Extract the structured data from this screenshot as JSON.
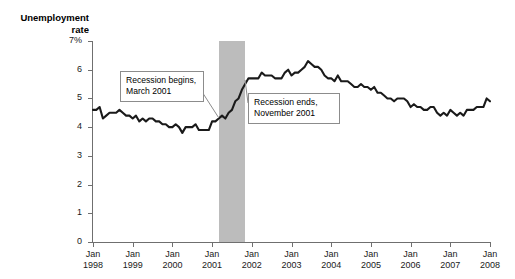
{
  "chart_data": {
    "type": "line",
    "title": "Unemployment\nrate",
    "xlabel": "",
    "ylabel": "Unemployment rate",
    "ylim": [
      0,
      7
    ],
    "ytick_labels": [
      "7%",
      "6",
      "5",
      "4",
      "3",
      "2",
      "1",
      "0"
    ],
    "ytick_values": [
      7,
      6,
      5,
      4,
      3,
      2,
      1,
      0
    ],
    "xtick_labels": [
      "Jan\n1998",
      "Jan\n1999",
      "Jan\n2000",
      "Jan\n2001",
      "Jan\n2002",
      "Jan\n2003",
      "Jan\n2004",
      "Jan\n2005",
      "Jan\n2006",
      "Jan\n2007",
      "Jan\n2008"
    ],
    "xtick_values": [
      1998,
      1999,
      2000,
      2001,
      2002,
      2003,
      2004,
      2005,
      2006,
      2007,
      2008
    ],
    "grid": false,
    "legend": false,
    "line_color": "#1a1a1a",
    "band_color": "#bcbcbc",
    "x_start": 1998.0,
    "x_end": 2008.0,
    "series": [
      {
        "name": "Unemployment rate",
        "values": [
          4.6,
          4.6,
          4.7,
          4.3,
          4.4,
          4.5,
          4.5,
          4.5,
          4.6,
          4.5,
          4.4,
          4.4,
          4.3,
          4.4,
          4.2,
          4.3,
          4.2,
          4.3,
          4.3,
          4.2,
          4.2,
          4.1,
          4.1,
          4.0,
          4.0,
          4.1,
          4.0,
          3.8,
          4.0,
          4.0,
          4.0,
          4.1,
          3.9,
          3.9,
          3.9,
          3.9,
          4.2,
          4.2,
          4.3,
          4.4,
          4.3,
          4.5,
          4.6,
          4.9,
          5.0,
          5.3,
          5.5,
          5.7,
          5.7,
          5.7,
          5.7,
          5.9,
          5.8,
          5.8,
          5.8,
          5.7,
          5.7,
          5.7,
          5.9,
          6.0,
          5.8,
          5.9,
          5.9,
          6.0,
          6.1,
          6.3,
          6.2,
          6.1,
          6.1,
          6.0,
          5.8,
          5.7,
          5.7,
          5.6,
          5.8,
          5.6,
          5.6,
          5.6,
          5.5,
          5.4,
          5.4,
          5.5,
          5.4,
          5.4,
          5.3,
          5.4,
          5.2,
          5.2,
          5.1,
          5.0,
          5.0,
          4.9,
          5.0,
          5.0,
          5.0,
          4.9,
          4.7,
          4.8,
          4.7,
          4.7,
          4.6,
          4.6,
          4.7,
          4.7,
          4.5,
          4.4,
          4.5,
          4.4,
          4.6,
          4.5,
          4.4,
          4.5,
          4.4,
          4.6,
          4.6,
          4.6,
          4.7,
          4.7,
          4.7,
          5.0,
          4.9
        ]
      }
    ],
    "annotations": [
      {
        "id": "recession-begins",
        "text": "Recession begins,\nMarch 2001",
        "target_x": 2001.17
      },
      {
        "id": "recession-ends",
        "text": "Recession ends,\nNovember 2001",
        "target_x": 2001.83
      }
    ],
    "shaded_region": {
      "label": "Recession",
      "start": 2001.17,
      "end": 2001.83
    }
  }
}
